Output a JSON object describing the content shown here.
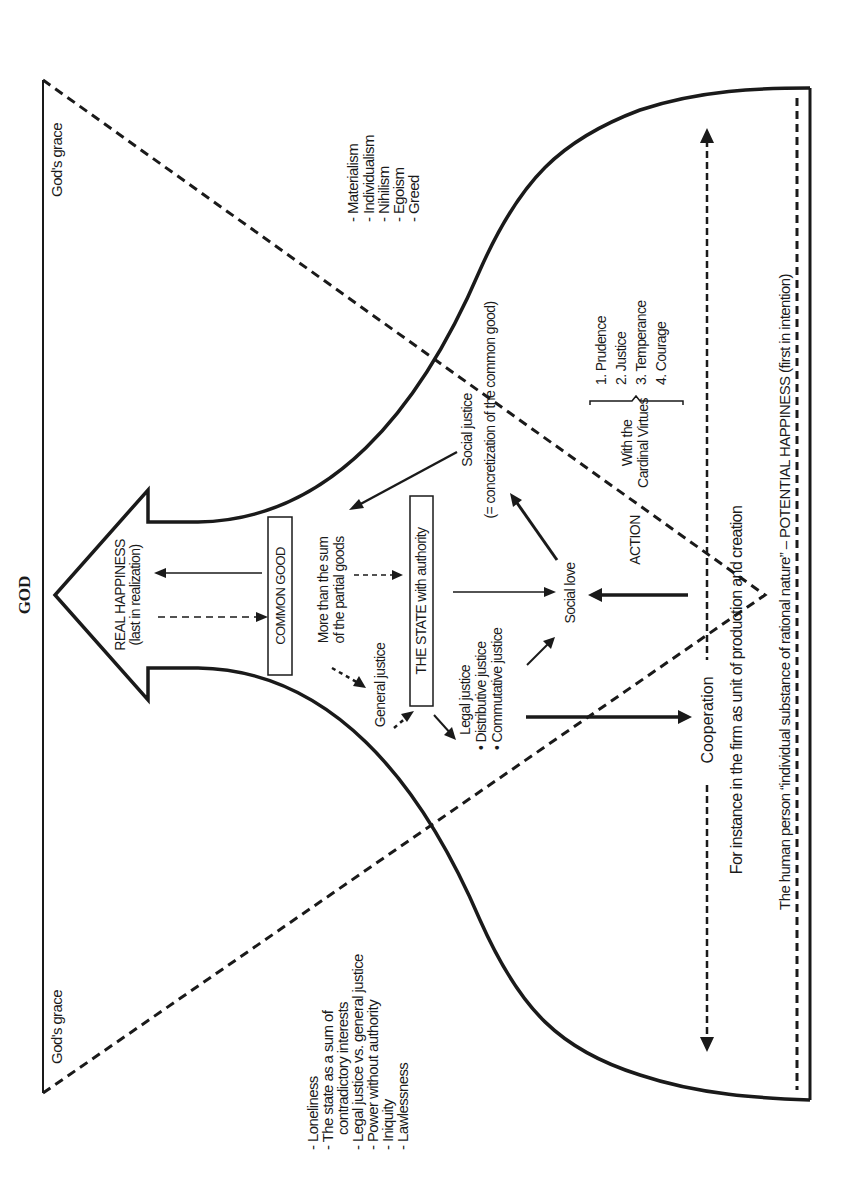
{
  "title": "GOD",
  "grace": {
    "top": "God's grace",
    "bottom": "God's grace"
  },
  "real_happiness": {
    "line1": "REAL HAPPINESS",
    "line2": "(last in realization)"
  },
  "common_good": {
    "box": "COMMON GOOD",
    "desc_line1": "More than the sum",
    "desc_line2": "of the partial goods"
  },
  "general_justice": "General justice",
  "state": {
    "box": "THE STATE with authority"
  },
  "legal_justice": {
    "title": "Legal justice",
    "items": [
      "• Distributive justice",
      "• Commutative justice"
    ]
  },
  "social_justice": {
    "line1": "Social justice",
    "line2": "(= concretization of the common good)"
  },
  "social_love": "Social love",
  "action": "ACTION",
  "cardinal_virtues": {
    "line1": "With the",
    "line2": "Cardinal Virtues",
    "items": [
      "1. Prudence",
      "2. Justice",
      "3. Temperance",
      "4. Courage"
    ]
  },
  "cooperation": "Cooperation",
  "firm_note": "For instance in the firm as unit of production and creation",
  "human_person": "The human person “individual substance of rational nature” – POTENTIAL HAPPINESS (first in intention)",
  "vices_right": [
    "- Materialism",
    "- Individualism",
    "- Nihilism",
    "- Egoism",
    "- Greed"
  ],
  "vices_left": [
    "- Loneliness",
    "- The state as a sum of",
    "contradictory interests",
    "- Legal justice vs. general justice",
    "- Power without authority",
    "- Iniquity",
    "- Lawlessness"
  ],
  "colors": {
    "ink": "#1a1a1a",
    "background": "#ffffff"
  }
}
